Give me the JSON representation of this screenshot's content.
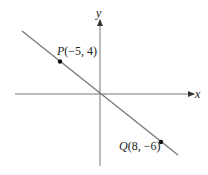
{
  "figure": {
    "axes": {
      "x_label": "x",
      "y_label": "y",
      "color": "#555555"
    },
    "line": {
      "color": "#6e6e6e",
      "description": "line through P and Q passing near origin"
    },
    "points": [
      {
        "name": "P",
        "coords": "(−5, 4)",
        "x": -5,
        "y": 4
      },
      {
        "name": "Q",
        "coords": "(8, −6)",
        "x": 8,
        "y": -6
      }
    ]
  }
}
